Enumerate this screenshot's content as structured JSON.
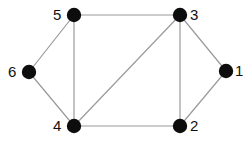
{
  "figure": {
    "type": "undirected-graph-diagram",
    "background_color": "#ffffff",
    "edge_color": "#9a9a9a",
    "edge_width": 1.2,
    "node_color": "#0d0d0d",
    "node_radius": 7.2,
    "label_color": "#111111",
    "label_font_size": 15,
    "width": 251,
    "height": 143
  },
  "nodes": [
    {
      "id": "1",
      "label": "1",
      "cx": 226,
      "cy": 71,
      "label_x": 235,
      "label_y": 63,
      "label_side": "right"
    },
    {
      "id": "2",
      "label": "2",
      "cx": 180,
      "cy": 126,
      "label_x": 190,
      "label_y": 118,
      "label_side": "right"
    },
    {
      "id": "3",
      "label": "3",
      "cx": 180,
      "cy": 15,
      "label_x": 190,
      "label_y": 7,
      "label_side": "right"
    },
    {
      "id": "4",
      "label": "4",
      "cx": 74,
      "cy": 126,
      "label_x": 53,
      "label_y": 118,
      "label_side": "left"
    },
    {
      "id": "5",
      "label": "5",
      "cx": 74,
      "cy": 15,
      "label_x": 53,
      "label_y": 7,
      "label_side": "left"
    },
    {
      "id": "6",
      "label": "6",
      "cx": 29,
      "cy": 72,
      "label_x": 8,
      "label_y": 64,
      "label_side": "left"
    }
  ],
  "edges": [
    {
      "id": "edge-5-3",
      "source": "5",
      "target": "3"
    },
    {
      "id": "edge-5-6",
      "source": "5",
      "target": "6"
    },
    {
      "id": "edge-5-4",
      "source": "5",
      "target": "4"
    },
    {
      "id": "edge-6-4",
      "source": "6",
      "target": "4"
    },
    {
      "id": "edge-4-3",
      "source": "4",
      "target": "3"
    },
    {
      "id": "edge-4-2",
      "source": "4",
      "target": "2"
    },
    {
      "id": "edge-3-2",
      "source": "3",
      "target": "2"
    },
    {
      "id": "edge-3-1",
      "source": "3",
      "target": "1"
    },
    {
      "id": "edge-1-2",
      "source": "1",
      "target": "2"
    }
  ]
}
